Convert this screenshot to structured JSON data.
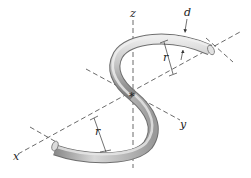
{
  "figure": {
    "type": "3D line drawing of an S-shaped bent rod (two semicircular arcs) with coordinate axes",
    "axes": {
      "x": {
        "label": "x"
      },
      "y": {
        "label": "y"
      },
      "z": {
        "label": "z"
      }
    },
    "dimensions": {
      "diameter": {
        "label": "d"
      },
      "radius_upper": {
        "label": "r"
      },
      "radius_lower": {
        "label": "r"
      }
    },
    "origin_marker": "*",
    "colors": {
      "rod_light": "#e6e6e6",
      "rod_mid": "#b5b5b5",
      "rod_dark": "#7a7a7a",
      "lines": "#444444",
      "background": "#ffffff"
    }
  }
}
